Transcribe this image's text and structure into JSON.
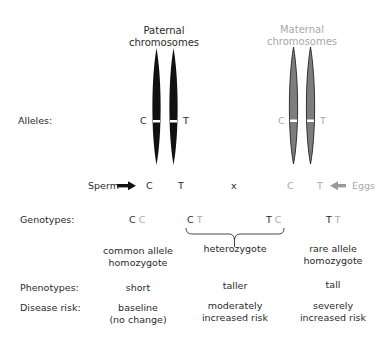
{
  "titles": {
    "paternal": [
      "Paternal",
      "chromosomes"
    ],
    "maternal": [
      "Maternal",
      "chromosomes"
    ]
  },
  "labels": {
    "alleles": "Alleles:",
    "genotypes": "Genotypes:",
    "phenotypes": "Phenotypes:",
    "disease_risk": "Disease risk:"
  },
  "alleles": {
    "paternal": [
      "C",
      "T"
    ],
    "maternal": [
      "C",
      "T"
    ]
  },
  "gametes": {
    "sperm_label": "Sperm",
    "sperm_alleles": [
      "C",
      "T"
    ],
    "cross_symbol": "x",
    "egg_alleles": [
      "C",
      "T"
    ],
    "eggs_label": "Eggs"
  },
  "genotypes": [
    {
      "paternal": "C",
      "maternal": "C"
    },
    {
      "paternal": "C",
      "maternal": "T"
    },
    {
      "paternal": "T",
      "maternal": "C"
    },
    {
      "paternal": "T",
      "maternal": "T"
    }
  ],
  "classes": [
    {
      "name": [
        "common allele",
        "homozygote"
      ],
      "phenotype": "short",
      "risk": [
        "baseline",
        "(no change)"
      ]
    },
    {
      "name": [
        "heterozygote"
      ],
      "phenotype": "taller",
      "risk": [
        "moderately",
        "increased risk"
      ]
    },
    {
      "name": [
        "rare allele",
        "homozygote"
      ],
      "phenotype": "tall",
      "risk": [
        "severely",
        "increased risk"
      ]
    }
  ],
  "colors": {
    "paternal": "#111111",
    "maternal_fill": "#7d7d7d",
    "maternal_text": "#a9a9a9",
    "text": "#2a2a2a"
  }
}
